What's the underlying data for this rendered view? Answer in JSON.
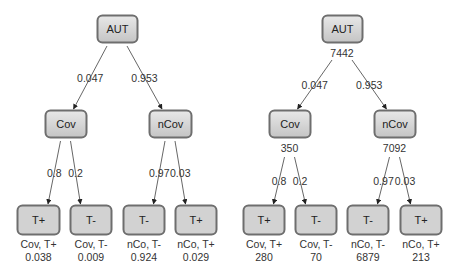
{
  "colors": {
    "node_border": "#6e6e6e",
    "node_fill_top": "#e8e8e8",
    "node_fill_bottom": "#c4c4c4",
    "leaf_fill": "#d2d2d2",
    "edge": "#555555",
    "text": "#222222"
  },
  "trees": [
    {
      "name": "probability-tree",
      "root": {
        "label": "AUT",
        "x": 97,
        "y": 15,
        "w": 40,
        "h": 27,
        "count": ""
      },
      "branches": [
        {
          "label": "Cov",
          "x": 45,
          "y": 110,
          "w": 41,
          "h": 27,
          "count": "",
          "edge_label": "0.047",
          "leaves": [
            {
              "label": "T+",
              "x": 17,
              "y": 205,
              "w": 42,
              "h": 29,
              "edge_label": "0.8",
              "caption": "Cov, T+",
              "value": "0.038"
            },
            {
              "label": "T-",
              "x": 70,
              "y": 205,
              "w": 41,
              "h": 29,
              "edge_label": "0.2",
              "caption": "Cov, T-",
              "value": "0.009"
            }
          ]
        },
        {
          "label": "nCov",
          "x": 149,
          "y": 110,
          "w": 42,
          "h": 27,
          "count": "",
          "edge_label": "0.953",
          "leaves": [
            {
              "label": "T-",
              "x": 123,
              "y": 205,
              "w": 41,
              "h": 29,
              "edge_label": "0.97",
              "caption": "nCo, T-",
              "value": "0.924"
            },
            {
              "label": "T+",
              "x": 175,
              "y": 205,
              "w": 41,
              "h": 29,
              "edge_label": "0.03",
              "caption": "nCo, T+",
              "value": "0.029"
            }
          ]
        }
      ]
    },
    {
      "name": "frequency-tree",
      "root": {
        "label": "AUT",
        "x": 322,
        "y": 15,
        "w": 40,
        "h": 27,
        "count": "7442"
      },
      "branches": [
        {
          "label": "Cov",
          "x": 269,
          "y": 110,
          "w": 41,
          "h": 27,
          "count": "350",
          "edge_label": "0.047",
          "leaves": [
            {
              "label": "T+",
              "x": 243,
              "y": 205,
              "w": 41,
              "h": 29,
              "edge_label": "0.8",
              "caption": "Cov, T+",
              "value": "280"
            },
            {
              "label": "T-",
              "x": 295,
              "y": 205,
              "w": 41,
              "h": 29,
              "edge_label": "0.2",
              "caption": "Cov, T-",
              "value": "70"
            }
          ]
        },
        {
          "label": "nCov",
          "x": 374,
          "y": 110,
          "w": 41,
          "h": 27,
          "count": "7092",
          "edge_label": "0.953",
          "leaves": [
            {
              "label": "T-",
              "x": 347,
              "y": 205,
              "w": 41,
              "h": 29,
              "edge_label": "0.97",
              "caption": "nCo, T-",
              "value": "6879"
            },
            {
              "label": "T+",
              "x": 400,
              "y": 205,
              "w": 41,
              "h": 29,
              "edge_label": "0.03",
              "caption": "nCo, T+",
              "value": "213"
            }
          ]
        }
      ]
    }
  ]
}
